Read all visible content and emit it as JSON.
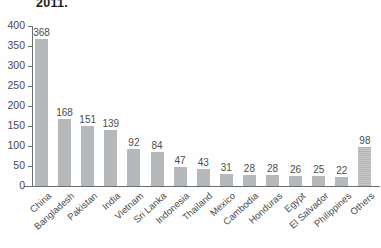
{
  "chart_data": {
    "type": "bar",
    "title": "2011.",
    "xlabel": "",
    "ylabel": "",
    "ylim": [
      0,
      400
    ],
    "y_ticks": [
      400,
      350,
      300,
      250,
      200,
      150,
      100,
      50,
      0
    ],
    "grid": false,
    "legend": null,
    "bar_color": "#b6b9bb",
    "categories": [
      "China",
      "Bangladesh",
      "Pakistan",
      "India",
      "Vietnam",
      "Sri Lanka",
      "Indonesia",
      "Thailand",
      "Mexico",
      "Cambodia",
      "Honduras",
      "Egypt",
      "El Salvador",
      "Philippines",
      "Others"
    ],
    "values": [
      368,
      168,
      151,
      139,
      92,
      84,
      47,
      43,
      31,
      28,
      28,
      26,
      25,
      22,
      98
    ],
    "data_labels": [
      "368",
      "168",
      "151",
      "139",
      "92",
      "84",
      "47",
      "43",
      "31",
      "28",
      "28",
      "26",
      "25",
      "22",
      "98"
    ]
  }
}
